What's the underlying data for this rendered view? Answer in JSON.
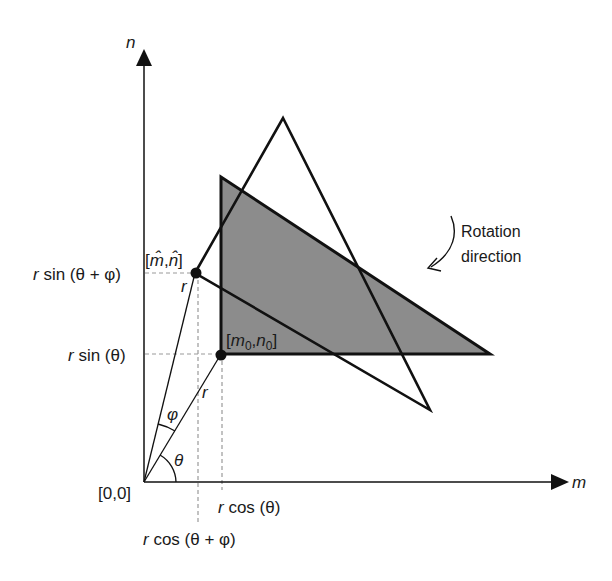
{
  "diagram": {
    "title": "",
    "axes": {
      "horizontal_label": "m",
      "vertical_label": "n",
      "origin_label": "[0,0]"
    },
    "points": {
      "original": {
        "label_main_m": "m",
        "label_sub_m": "0",
        "label_main_n": "n",
        "label_sub_n": "0",
        "open": "[",
        "comma": ",",
        "close": "]"
      },
      "rotated": {
        "label_m": "m̂",
        "label_n": "n̂",
        "open": "[",
        "comma": ",",
        "close": "]"
      }
    },
    "radius_label": "r",
    "angle_labels": {
      "theta": "θ",
      "phi": "φ"
    },
    "projection_labels": {
      "y_rotated": {
        "r": "r",
        "rest": " sin (θ + φ)"
      },
      "y_original": {
        "r": "r",
        "rest": " sin (θ)"
      },
      "x_original": {
        "r": "r",
        "rest": " cos (θ)"
      },
      "x_rotated": {
        "r": "r",
        "rest": " cos (θ + φ)"
      }
    },
    "annotation": {
      "line1": "Rotation",
      "line2": "direction"
    },
    "shapes": [
      {
        "name": "original-triangle",
        "style": "filled",
        "fill": "#8c8c8c"
      },
      {
        "name": "rotated-triangle",
        "style": "outline"
      }
    ],
    "colors": {
      "stroke": "#111111",
      "fill": "#8c8c8c",
      "guide": "#9a9a9a"
    }
  }
}
